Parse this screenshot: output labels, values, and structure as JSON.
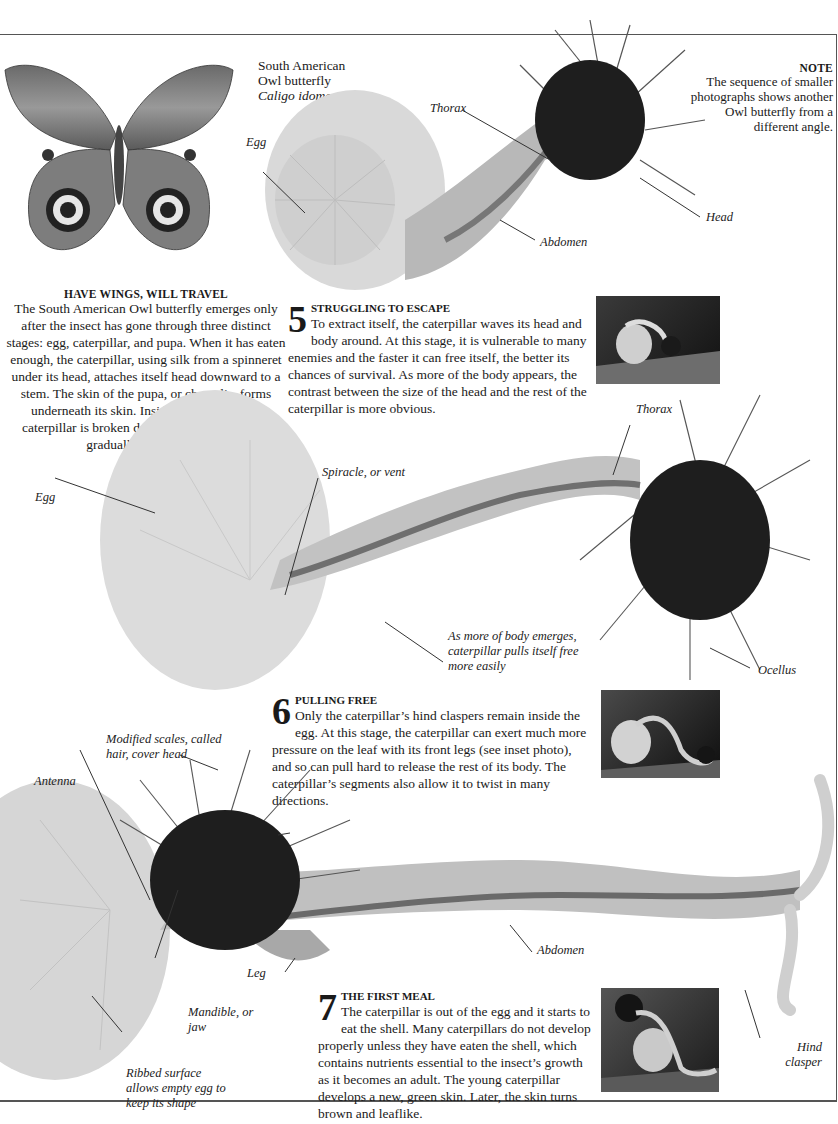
{
  "intro": {
    "title": "HAVE WINGS, WILL TRAVEL",
    "body": "The South American Owl butterfly emerges only after the insect has gone through three distinct stages: egg, caterpillar, and pupa. When it has eaten enough, the caterpillar, using silk from a spinneret under its head, attaches itself head downward to a stem. The skin of the pupa, or chrysalis, forms underneath its skin. Inside, the body of the caterpillar is broken down, and the adult body gradually takes shape."
  },
  "species": {
    "line1": "South American",
    "line2": "Owl butterfly",
    "scientific": "Caligo idomeneus"
  },
  "note": {
    "title": "NOTE",
    "body": "The sequence of smaller photographs shows another Owl butterfly from a different angle."
  },
  "stages": [
    {
      "number": "5",
      "title": "STRUGGLING TO ESCAPE",
      "body": "To extract itself, the caterpillar waves its head and body around. At this stage, it is vulnerable to many enemies and the faster it can free itself, the better its chances of survival. As more of the body appears, the contrast between the size of the head and the rest of the caterpillar is more obvious."
    },
    {
      "number": "6",
      "title": "PULLING FREE",
      "body": "Only the caterpillar’s hind claspers remain inside the egg. At this stage, the caterpillar can exert much more pressure on the leaf with its front legs (see inset photo), and so can pull hard to release the rest of its body. The caterpillar’s segments also allow it to twist in many directions."
    },
    {
      "number": "7",
      "title": "THE FIRST MEAL",
      "body": "The caterpillar is out of the egg and it starts to eat the shell. Many caterpillars do not develop properly unless they have eaten the shell, which contains nutrients essential to the insect’s growth as it becomes an adult. The young caterpillar develops a new, green skin. Later, the skin turns brown and leaflike."
    }
  ],
  "labels": {
    "s5": {
      "egg": "Egg",
      "thorax": "Thorax",
      "head": "Head",
      "abdomen": "Abdomen"
    },
    "s6": {
      "egg": "Egg",
      "spiracle": "Spiracle, or vent",
      "thorax": "Thorax",
      "body_emerges": "As more of body emerges, caterpillar pulls itself free more easily",
      "ocellus": "Ocellus"
    },
    "s7": {
      "scales": "Modified scales, called hair, cover head",
      "antenna": "Antenna",
      "leg": "Leg",
      "mandible": "Mandible, or jaw",
      "ribbed": "Ribbed surface allows empty egg to keep its shape",
      "abdomen": "Abdomen",
      "hind_clasper": "Hind clasper"
    }
  },
  "colors": {
    "rule": "#555555",
    "text": "#1a1a1a",
    "egg": "#d6d6d6",
    "head": "#1e1e1e"
  }
}
